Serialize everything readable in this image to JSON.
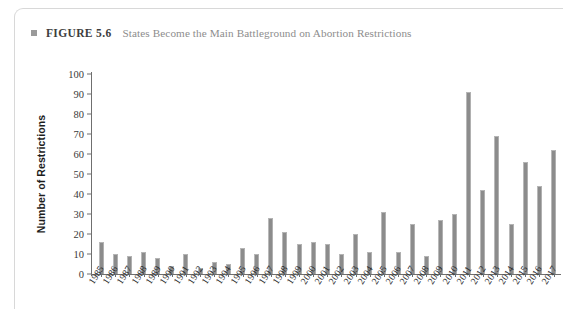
{
  "figure": {
    "bullet_icon": "square-bullet-icon",
    "label": "FIGURE 5.6",
    "title": "States Become the Main Battleground on Abortion Restrictions"
  },
  "colors": {
    "bar": "#8c8c8c",
    "axis": "#6f6f6f",
    "title_text": "#8d8d8d",
    "label_text": "#3d3d3d",
    "card_border": "#d8d8d8",
    "background": "#ffffff"
  },
  "chart_data": {
    "type": "bar",
    "title": "States Become the Main Battleground on Abortion Restrictions",
    "xlabel": "",
    "ylabel": "Number of Restrictions",
    "ylim": [
      0,
      100
    ],
    "yticks": [
      0,
      10,
      20,
      30,
      40,
      50,
      60,
      70,
      80,
      90,
      100
    ],
    "ytick_labels": [
      "0",
      "10",
      "20",
      "30",
      "40",
      "50",
      "60",
      "70",
      "80",
      "90",
      "100"
    ],
    "grid": false,
    "legend": "none",
    "categories": [
      "1985",
      "1986",
      "1987",
      "1988",
      "1989",
      "1990",
      "1991",
      "1992",
      "1993",
      "1994",
      "1995",
      "1996",
      "1997",
      "1998",
      "1999",
      "2000",
      "2001",
      "2002",
      "2003",
      "2004",
      "2005",
      "2006",
      "2007",
      "2008",
      "2009",
      "2010",
      "2011",
      "2012",
      "2013",
      "2014",
      "2015",
      "2016",
      "2017"
    ],
    "values": [
      16,
      10,
      9,
      11,
      8,
      4,
      10,
      3,
      6,
      5,
      13,
      10,
      28,
      21,
      15,
      16,
      15,
      10,
      20,
      11,
      31,
      11,
      25,
      9,
      27,
      30,
      91,
      42,
      69,
      25,
      56,
      44,
      62
    ]
  }
}
